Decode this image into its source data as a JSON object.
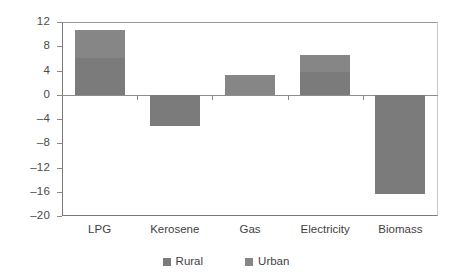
{
  "chart_data": {
    "type": "bar",
    "stacked": true,
    "title": "",
    "subtitle": "",
    "xlabel": "",
    "ylabel": "Mtoe",
    "categories": [
      "LPG",
      "Kerosene",
      "Gas",
      "Electricity",
      "Biomass"
    ],
    "series": [
      {
        "name": "Rural",
        "color": "#7b7b7b",
        "values": [
          6.1,
          -5.2,
          0.0,
          3.7,
          -16.3
        ]
      },
      {
        "name": "Urban",
        "color": "#868686",
        "values": [
          4.5,
          0.0,
          3.3,
          2.8,
          0.0
        ]
      }
    ],
    "totals": [
      10.6,
      -5.2,
      3.3,
      6.5,
      -16.3
    ],
    "ylim": [
      -20,
      12
    ],
    "ytick_labels": [
      "12",
      "8",
      "4",
      "0",
      "-4",
      "-8",
      "-12",
      "-16",
      "-20"
    ],
    "ytick_values": [
      12,
      8,
      4,
      0,
      -4,
      -8,
      -12,
      -16,
      -20
    ],
    "grid": false,
    "legend_position": "bottom-center",
    "legend_entries": [
      "Rural",
      "Urban"
    ],
    "units": "Mtoe"
  },
  "axis": {
    "y_title": "Mtoe"
  },
  "legend": {
    "items": [
      {
        "label": "Rural",
        "color": "#7b7b7b"
      },
      {
        "label": "Urban",
        "color": "#868686"
      }
    ]
  }
}
